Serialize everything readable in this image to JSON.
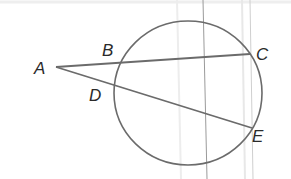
{
  "diagram": {
    "type": "circle-secants",
    "colors": {
      "stroke": "#6b6b6b",
      "text": "#2a2a2a",
      "background": "#ffffff",
      "scan_line": "#e6e6e6",
      "scan_line_dark": "#9a9a9a"
    },
    "circle": {
      "cx": 188,
      "cy": 93,
      "rx": 74,
      "ry": 72
    },
    "points": {
      "A": {
        "label": "A",
        "x": 56,
        "y": 67
      },
      "B": {
        "label": "B",
        "x": 121,
        "y": 62
      },
      "C": {
        "label": "C",
        "x": 250,
        "y": 54
      },
      "D": {
        "label": "D",
        "x": 115,
        "y": 86
      },
      "E": {
        "label": "E",
        "x": 252,
        "y": 128
      }
    },
    "segments": [
      {
        "from": "A",
        "to": "C"
      },
      {
        "from": "A",
        "to": "E"
      }
    ]
  }
}
